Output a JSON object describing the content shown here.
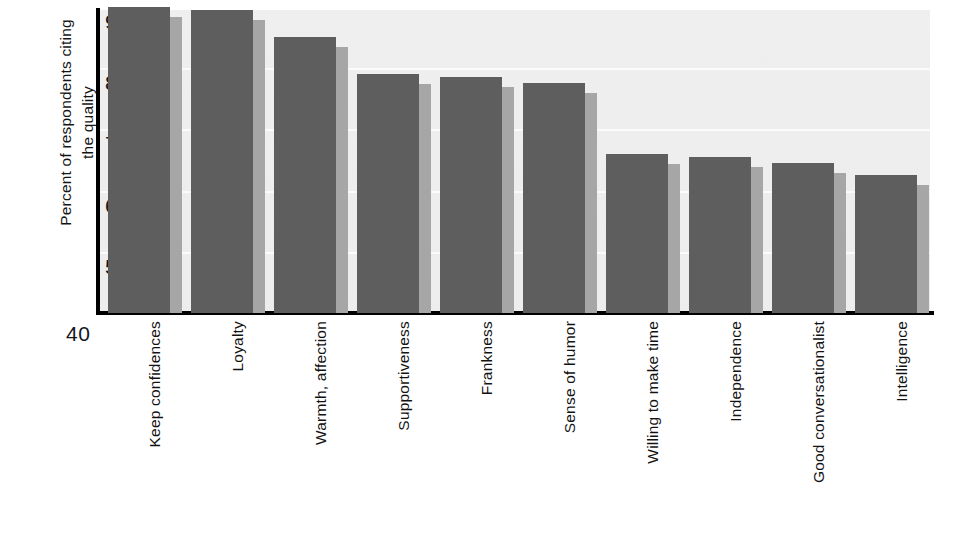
{
  "chart_data": {
    "type": "bar",
    "title": "",
    "subtitle": "",
    "xlabel": "",
    "ylabel": "Percent of respondents citing\nthe quality",
    "ylim": [
      40,
      92
    ],
    "ytick_labels": [
      "90",
      "80",
      "70",
      "60",
      "50"
    ],
    "ytick_values": [
      90,
      80,
      70,
      60,
      50
    ],
    "axis_origin_label": "40",
    "grid": true,
    "grid_orientation": "horizontal",
    "legend": "none",
    "bar_color": "#5e5e5e",
    "bar_shadow_color": "#a6a6a6",
    "plot_background": "#eeeeee",
    "categories": [
      "Keep confidences",
      "Loyalty",
      "Warmth, affection",
      "Supportiveness",
      "Frankness",
      "Sense of humor",
      "Willing to make time",
      "Independence",
      "Good conversationalist",
      "Intelligence"
    ],
    "values": [
      90,
      89.5,
      85,
      79,
      78.5,
      77.5,
      66,
      65.5,
      64.5,
      62.5
    ]
  }
}
